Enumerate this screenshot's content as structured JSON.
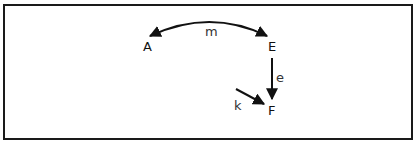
{
  "diagram": {
    "type": "directed-graph",
    "nodes": [
      {
        "id": "A",
        "label": "A",
        "x": 148,
        "y": 51
      },
      {
        "id": "E",
        "label": "E",
        "x": 272,
        "y": 51
      },
      {
        "id": "F",
        "label": "F",
        "x": 272,
        "y": 115
      }
    ],
    "edges": [
      {
        "id": "m",
        "label": "m",
        "from": "E",
        "to": "A",
        "bidirectional": true,
        "style": "arc"
      },
      {
        "id": "e",
        "label": "e",
        "from": "E",
        "to": "F",
        "bidirectional": false,
        "style": "straight"
      },
      {
        "id": "k",
        "label": "k",
        "from": null,
        "to": "F",
        "bidirectional": false,
        "style": "straight"
      }
    ],
    "colors": {
      "stroke": "#111111",
      "border": "#1a1a1a",
      "background": "#ffffff"
    }
  }
}
